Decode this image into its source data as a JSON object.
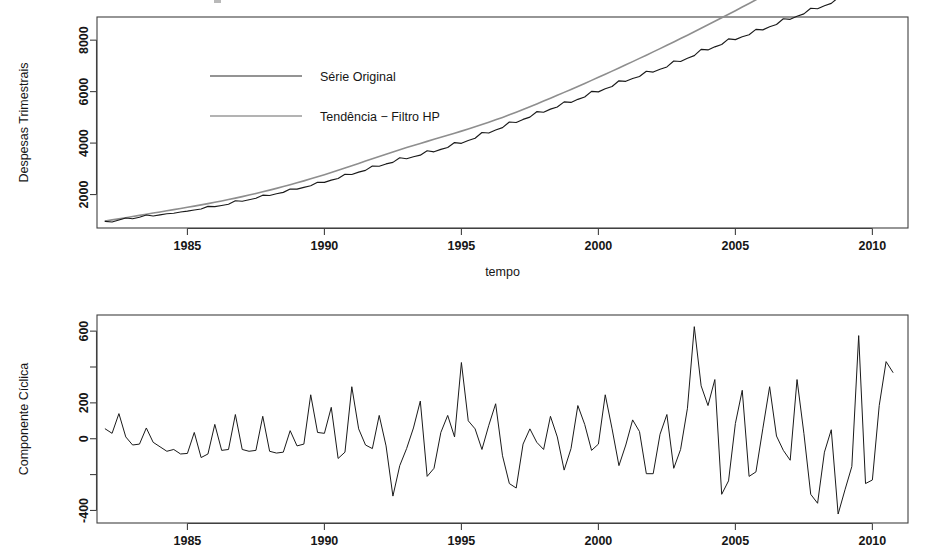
{
  "figure": {
    "title": "",
    "background": "#ffffff",
    "series_color": "#1a1a1a",
    "trend_color": "#8e8e8e"
  },
  "panels": {
    "top": {
      "name": "despesas-trimestrais-plot",
      "ylabel": "Despesas Trimestrais",
      "xlabel": "tempo",
      "legend": {
        "position": "top-left-inside",
        "entries": [
          {
            "label": "Série Original",
            "color": "#1a1a1a",
            "style": "solid"
          },
          {
            "label": "Tendência − Filtro HP",
            "color": "#8e8e8e",
            "style": "solid"
          }
        ]
      },
      "yticks": [
        {
          "value": 2000,
          "label": "2000"
        },
        {
          "value": 4000,
          "label": "4000"
        },
        {
          "value": 6000,
          "label": "6000"
        },
        {
          "value": 8000,
          "label": "8000"
        }
      ],
      "xticks": [
        {
          "value": 1985,
          "label": "1985"
        },
        {
          "value": 1990,
          "label": "1990"
        },
        {
          "value": 1995,
          "label": "1995"
        },
        {
          "value": 2000,
          "label": "2000"
        },
        {
          "value": 2005,
          "label": "2005"
        },
        {
          "value": 2010,
          "label": "2010"
        }
      ],
      "xlim": [
        1981.7,
        2011.3
      ],
      "ylim": [
        700,
        8900
      ]
    },
    "bottom": {
      "name": "componente-ciclica-plot",
      "ylabel": "Componente Cíclica",
      "xlabel": "",
      "yticks": [
        {
          "value": -400,
          "label": "-400"
        },
        {
          "value": -200,
          "label": ""
        },
        {
          "value": 0,
          "label": "0"
        },
        {
          "value": 200,
          "label": "200"
        },
        {
          "value": 400,
          "label": ""
        },
        {
          "value": 600,
          "label": "600"
        }
      ],
      "xticks": [
        {
          "value": 1985,
          "label": "1985"
        },
        {
          "value": 1990,
          "label": "1990"
        },
        {
          "value": 1995,
          "label": "1995"
        },
        {
          "value": 2000,
          "label": "2000"
        },
        {
          "value": 2005,
          "label": "2005"
        },
        {
          "value": 2010,
          "label": "2010"
        }
      ],
      "xlim": [
        1981.7,
        2011.3
      ],
      "ylim": [
        -470,
        690
      ]
    }
  },
  "chart_data": [
    {
      "type": "line",
      "id": "top",
      "title": "",
      "xlabel": "tempo",
      "ylabel": "Despesas Trimestrais",
      "xlim": [
        1981.7,
        2011.3
      ],
      "ylim": [
        700,
        8900
      ],
      "grid": false,
      "legend": [
        "Série Original",
        "Tendência − Filtro HP"
      ],
      "x": [
        1982.0,
        1982.25,
        1982.5,
        1982.75,
        1983.0,
        1983.25,
        1983.5,
        1983.75,
        1984.0,
        1984.25,
        1984.5,
        1984.75,
        1985.0,
        1985.25,
        1985.5,
        1985.75,
        1986.0,
        1986.25,
        1986.5,
        1986.75,
        1987.0,
        1987.25,
        1987.5,
        1987.75,
        1988.0,
        1988.25,
        1988.5,
        1988.75,
        1989.0,
        1989.25,
        1989.5,
        1989.75,
        1990.0,
        1990.25,
        1990.5,
        1990.75,
        1991.0,
        1991.25,
        1991.5,
        1991.75,
        1992.0,
        1992.25,
        1992.5,
        1992.75,
        1993.0,
        1993.25,
        1993.5,
        1993.75,
        1994.0,
        1994.25,
        1994.5,
        1994.75,
        1995.0,
        1995.25,
        1995.5,
        1995.75,
        1996.0,
        1996.25,
        1996.5,
        1996.75,
        1997.0,
        1997.25,
        1997.5,
        1997.75,
        1998.0,
        1998.25,
        1998.5,
        1998.75,
        1999.0,
        1999.25,
        1999.5,
        1999.75,
        2000.0,
        2000.25,
        2000.5,
        2000.75,
        2001.0,
        2001.25,
        2001.5,
        2001.75,
        2002.0,
        2002.25,
        2002.5,
        2002.75,
        2003.0,
        2003.25,
        2003.5,
        2003.75,
        2004.0,
        2004.25,
        2004.5,
        2004.75,
        2005.0,
        2005.25,
        2005.5,
        2005.75,
        2006.0,
        2006.25,
        2006.5,
        2006.75,
        2007.0,
        2007.25,
        2007.5,
        2007.75,
        2008.0,
        2008.25,
        2008.5,
        2008.75,
        2009.0,
        2009.25,
        2009.5,
        2009.75,
        2010.0,
        2010.25,
        2010.5,
        2010.75
      ],
      "series": [
        {
          "name": "Série Original",
          "color": "#1a1a1a",
          "values": [
            960,
            935,
            1010,
            1090,
            1060,
            1120,
            1205,
            1165,
            1210,
            1255,
            1275,
            1320,
            1355,
            1400,
            1440,
            1540,
            1530,
            1575,
            1625,
            1760,
            1740,
            1800,
            1855,
            1975,
            1965,
            2030,
            2085,
            2215,
            2210,
            2280,
            2340,
            2480,
            2475,
            2560,
            2625,
            2790,
            2780,
            2870,
            2940,
            3110,
            3100,
            3190,
            3250,
            3430,
            3390,
            3470,
            3530,
            3700,
            3660,
            3755,
            3830,
            4020,
            3990,
            4100,
            4190,
            4410,
            4390,
            4510,
            4600,
            4820,
            4800,
            4920,
            5010,
            5220,
            5200,
            5320,
            5400,
            5600,
            5580,
            5700,
            5790,
            6010,
            5990,
            6110,
            6200,
            6420,
            6400,
            6510,
            6590,
            6790,
            6760,
            6870,
            6960,
            7190,
            7170,
            7300,
            7400,
            7640,
            7620,
            7740,
            7830,
            8050,
            8020,
            8130,
            8210,
            8420,
            8400,
            8520,
            8610,
            8830,
            8810,
            8930,
            9020,
            9240,
            9220,
            9340,
            9430,
            9650,
            9630,
            9750,
            9840,
            10060,
            10040,
            10160,
            10250,
            10470
          ]
        },
        {
          "name": "Tendência − Filtro HP",
          "color": "#8e8e8e",
          "values": [
            975,
            1015,
            1055,
            1100,
            1145,
            1190,
            1235,
            1280,
            1325,
            1370,
            1415,
            1460,
            1505,
            1550,
            1598,
            1648,
            1700,
            1752,
            1806,
            1862,
            1920,
            1980,
            2042,
            2106,
            2172,
            2240,
            2310,
            2382,
            2456,
            2532,
            2610,
            2690,
            2772,
            2856,
            2942,
            3030,
            3120,
            3210,
            3300,
            3390,
            3480,
            3568,
            3655,
            3740,
            3824,
            3906,
            3987,
            4067,
            4146,
            4225,
            4304,
            4384,
            4465,
            4548,
            4633,
            4720,
            4810,
            4903,
            4999,
            5098,
            5200,
            5305,
            5412,
            5521,
            5632,
            5744,
            5857,
            5971,
            6086,
            6202,
            6319,
            6437,
            6556,
            6676,
            6797,
            6919,
            7042,
            7166,
            7291,
            7417,
            7544,
            7672,
            7801,
            7931,
            8062,
            8194,
            8327,
            8461,
            8596,
            8732,
            8869,
            9007,
            9146,
            9286,
            9427,
            9569,
            9712,
            9856,
            10001,
            10147,
            10294,
            10442,
            10591,
            10741,
            10892,
            11044,
            11197,
            11351,
            11506,
            11662,
            11819,
            11977,
            12136,
            12296,
            12457,
            12619
          ]
        }
      ]
    },
    {
      "type": "line",
      "id": "bottom",
      "title": "",
      "xlabel": "",
      "ylabel": "Componente Cíclica",
      "xlim": [
        1981.7,
        2011.3
      ],
      "ylim": [
        -470,
        690
      ],
      "grid": false,
      "legend": [],
      "x": [
        1982.0,
        1982.25,
        1982.5,
        1982.75,
        1983.0,
        1983.25,
        1983.5,
        1983.75,
        1984.0,
        1984.25,
        1984.5,
        1984.75,
        1985.0,
        1985.25,
        1985.5,
        1985.75,
        1986.0,
        1986.25,
        1986.5,
        1986.75,
        1987.0,
        1987.25,
        1987.5,
        1987.75,
        1988.0,
        1988.25,
        1988.5,
        1988.75,
        1989.0,
        1989.25,
        1989.5,
        1989.75,
        1990.0,
        1990.25,
        1990.5,
        1990.75,
        1991.0,
        1991.25,
        1991.5,
        1991.75,
        1992.0,
        1992.25,
        1992.5,
        1992.75,
        1993.0,
        1993.25,
        1993.5,
        1993.75,
        1994.0,
        1994.25,
        1994.5,
        1994.75,
        1995.0,
        1995.25,
        1995.5,
        1995.75,
        1996.0,
        1996.25,
        1996.5,
        1996.75,
        1997.0,
        1997.25,
        1997.5,
        1997.75,
        1998.0,
        1998.25,
        1998.5,
        1998.75,
        1999.0,
        1999.25,
        1999.5,
        1999.75,
        2000.0,
        2000.25,
        2000.5,
        2000.75,
        2001.0,
        2001.25,
        2001.5,
        2001.75,
        2002.0,
        2002.25,
        2002.5,
        2002.75,
        2003.0,
        2003.25,
        2003.5,
        2003.75,
        2004.0,
        2004.25,
        2004.5,
        2004.75,
        2005.0,
        2005.25,
        2005.5,
        2005.75,
        2006.0,
        2006.25,
        2006.5,
        2006.75,
        2007.0,
        2007.25,
        2007.5,
        2007.75,
        2008.0,
        2008.25,
        2008.5,
        2008.75,
        2009.0,
        2009.25,
        2009.5,
        2009.75,
        2010.0,
        2010.25,
        2010.5,
        2010.75
      ],
      "series": [
        {
          "name": "Componente Cíclica",
          "color": "#1a1a1a",
          "values": [
            55,
            30,
            140,
            10,
            -35,
            -30,
            60,
            -20,
            -45,
            -70,
            -60,
            -85,
            -82,
            35,
            -105,
            -85,
            80,
            -65,
            -60,
            135,
            -60,
            -70,
            -65,
            125,
            -70,
            -80,
            -75,
            45,
            -40,
            -30,
            245,
            35,
            30,
            175,
            -110,
            -75,
            290,
            55,
            -35,
            -55,
            130,
            -40,
            -320,
            -150,
            -55,
            60,
            210,
            -210,
            -165,
            35,
            130,
            10,
            425,
            100,
            55,
            -60,
            75,
            195,
            -95,
            -250,
            -275,
            -30,
            55,
            -20,
            -60,
            125,
            10,
            -175,
            -55,
            185,
            80,
            -65,
            -30,
            245,
            55,
            -150,
            -35,
            105,
            40,
            -195,
            -195,
            25,
            135,
            -165,
            -60,
            170,
            625,
            295,
            185,
            330,
            -310,
            -235,
            85,
            270,
            -210,
            -185,
            55,
            290,
            15,
            -65,
            -120,
            330,
            30,
            -310,
            -360,
            -75,
            50,
            -420,
            -285,
            -155,
            575,
            -250,
            -230,
            185,
            430,
            370
          ]
        }
      ]
    }
  ]
}
